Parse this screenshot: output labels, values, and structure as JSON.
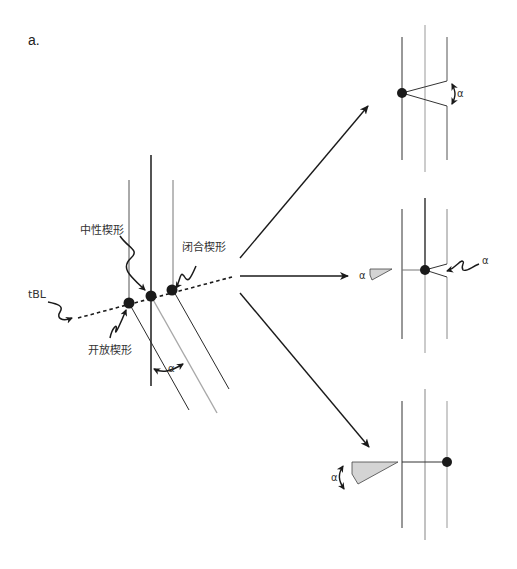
{
  "panel_label": "a.",
  "colors": {
    "line_dark": "#2a2a2a",
    "line_gray": "#a8a8a8",
    "dot": "#1a1a1a",
    "wedge_fill": "#d4d4d4",
    "text": "#333333"
  },
  "left_diagram": {
    "labels": {
      "neutral": "中性楔形",
      "closed": "闭合楔形",
      "open": "开放楔形",
      "tbl": "tBL",
      "alpha": "α"
    }
  },
  "panels": [
    {
      "name": "top-panel",
      "alpha_label": "α",
      "description": "wedge opens toward right line"
    },
    {
      "name": "middle-panel",
      "alpha_label_left": "α",
      "alpha_label_right": "α",
      "description": "dot on center line"
    },
    {
      "name": "bottom-panel",
      "alpha_label": "α",
      "description": "dot on right line"
    }
  ]
}
